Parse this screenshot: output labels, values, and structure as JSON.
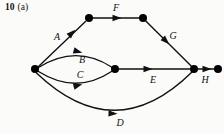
{
  "figure": {
    "number": "10",
    "part": "(a)"
  },
  "diagram": {
    "type": "activity-network-directed-graph",
    "background_color": "#fbfbf9",
    "ink_color": "#111111",
    "node_color": "#000000",
    "node_radius": 4,
    "nodes": [
      {
        "id": "n1",
        "name": "start-node",
        "x": 35,
        "y": 69
      },
      {
        "id": "n2",
        "name": "top-left-node",
        "x": 89,
        "y": 18
      },
      {
        "id": "n3",
        "name": "top-right-node",
        "x": 143,
        "y": 18
      },
      {
        "id": "n4",
        "name": "middle-node",
        "x": 115,
        "y": 69
      },
      {
        "id": "n5",
        "name": "junction-node",
        "x": 194,
        "y": 69
      },
      {
        "id": "n6",
        "name": "end-node",
        "x": 218,
        "y": 69
      }
    ],
    "edges": [
      {
        "id": "A",
        "label": "A",
        "from": "n1",
        "to": "n2",
        "shape": "straight",
        "label_x": 57,
        "label_y": 37,
        "path": "M 38.5 66.5 L 85.5 21.5",
        "arrow_x": 72,
        "arrow_y": 33,
        "arrow_angle": -44
      },
      {
        "id": "B",
        "label": "B",
        "from": "n1",
        "to": "n4",
        "shape": "curve-up",
        "label_x": 82,
        "label_y": 60,
        "path": "M 38.5 67.5 Q 76 44 111.5 67",
        "arrow_x": 78,
        "arrow_y": 51.5,
        "arrow_angle": 15
      },
      {
        "id": "C",
        "label": "C",
        "from": "n1",
        "to": "n4",
        "shape": "curve-down",
        "label_x": 80,
        "label_y": 75,
        "path": "M 38.5 71.5 Q 76 95 111.5 71.5",
        "arrow_x": 78,
        "arrow_y": 85.5,
        "arrow_angle": -15
      },
      {
        "id": "D",
        "label": "D",
        "from": "n1",
        "to": "n5",
        "shape": "curve-down-wide",
        "label_x": 120,
        "label_y": 123,
        "path": "M 36.5 73 Q 115 148 192 72",
        "arrow_x": 113,
        "arrow_y": 113.5,
        "arrow_angle": 2
      },
      {
        "id": "E",
        "label": "E",
        "from": "n4",
        "to": "n5",
        "shape": "straight",
        "label_x": 153,
        "label_y": 80,
        "path": "M 119 69 L 190 69",
        "arrow_x": 148,
        "arrow_y": 69,
        "arrow_angle": 0
      },
      {
        "id": "F",
        "label": "F",
        "from": "n2",
        "to": "n3",
        "shape": "straight",
        "label_x": 116,
        "label_y": 8,
        "path": "M 93 18 L 139 18",
        "arrow_x": 117,
        "arrow_y": 18,
        "arrow_angle": 0
      },
      {
        "id": "G",
        "label": "G",
        "from": "n3",
        "to": "n5",
        "shape": "straight",
        "label_x": 173,
        "label_y": 36,
        "path": "M 145.8 21 L 191.2 66",
        "arrow_x": 166,
        "arrow_y": 41,
        "arrow_angle": 44
      },
      {
        "id": "H",
        "label": "H",
        "from": "n5",
        "to": "n6",
        "shape": "straight",
        "label_x": 205,
        "label_y": 80,
        "path": "M 198 69 L 214 69",
        "arrow_x": 207,
        "arrow_y": 69,
        "arrow_angle": 0
      }
    ]
  }
}
